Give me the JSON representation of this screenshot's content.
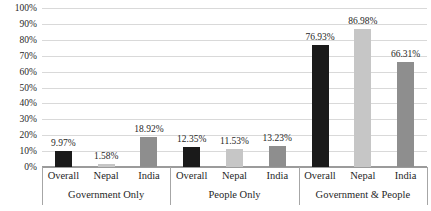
{
  "chart_data": {
    "type": "bar",
    "title": "",
    "legend": "none",
    "grid": true,
    "value_suffix": "%",
    "y_axis": {
      "min": 0,
      "max": 100,
      "step": 10,
      "tick_labels": [
        "0%",
        "10%",
        "20%",
        "30%",
        "40%",
        "50%",
        "60%",
        "70%",
        "80%",
        "90%",
        "100%"
      ]
    },
    "categories_per_group": [
      "Overall",
      "Nepal",
      "India"
    ],
    "groups": [
      {
        "label": "Government Only",
        "bars": [
          {
            "category": "Overall",
            "value": 9.97,
            "data_label": "9.97%"
          },
          {
            "category": "Nepal",
            "value": 1.58,
            "data_label": "1.58%"
          },
          {
            "category": "India",
            "value": 18.92,
            "data_label": "18.92%"
          }
        ]
      },
      {
        "label": "People Only",
        "bars": [
          {
            "category": "Overall",
            "value": 12.35,
            "data_label": "12.35%"
          },
          {
            "category": "Nepal",
            "value": 11.53,
            "data_label": "11.53%"
          },
          {
            "category": "India",
            "value": 13.23,
            "data_label": "13.23%"
          }
        ]
      },
      {
        "label": "Government & People",
        "bars": [
          {
            "category": "Overall",
            "value": 76.93,
            "data_label": "76.93%"
          },
          {
            "category": "Nepal",
            "value": 86.98,
            "data_label": "86.98%"
          },
          {
            "category": "India",
            "value": 66.31,
            "data_label": "66.31%"
          }
        ]
      }
    ],
    "series_colors": {
      "Overall": "#1a1a1a",
      "Nepal": "#c6c6c6",
      "India": "#8e8e8e"
    },
    "style_colors": {
      "background": "#ffffff",
      "gridline": "#d9d9d9",
      "axis_baseline": "#9b9b9b",
      "separator": "#a6a6a6",
      "text": "#1f1f1f"
    }
  }
}
